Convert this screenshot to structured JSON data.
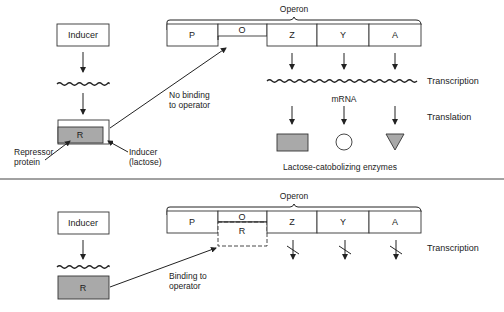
{
  "top_panel": {
    "inducer_box": "Inducer",
    "repressor_letter": "R",
    "repressor_label_1": "Repressor",
    "repressor_label_2": "protein",
    "inducer_label_1": "Inducer",
    "inducer_label_2": "(lactose)",
    "no_binding_1": "No binding",
    "no_binding_2": "to operator",
    "operon_label": "Operon",
    "genes": [
      "P",
      "O",
      "Z",
      "Y",
      "A"
    ],
    "transcription": "Transcription",
    "mrna": "mRNA",
    "translation": "Translation",
    "enzymes": "Lactose-catobolizing enzymes"
  },
  "bottom_panel": {
    "inducer_box": "Inducer",
    "repressor_letter": "R",
    "bound_repressor": "R",
    "binding_1": "Binding to",
    "binding_2": "operator",
    "operon_label": "Operon",
    "genes": [
      "P",
      "O",
      "Z",
      "Y",
      "A"
    ],
    "transcription": "Transcription"
  },
  "colors": {
    "repressor_fill": "#a9a9a9",
    "line": "#222222"
  }
}
